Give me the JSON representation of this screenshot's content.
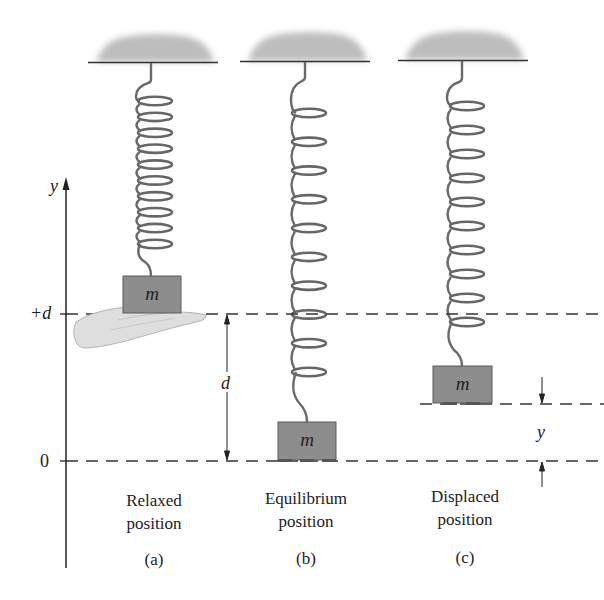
{
  "figure": {
    "axis": {
      "label": "y",
      "ticks": [
        {
          "label": "+d",
          "y": 314
        },
        {
          "label": "0",
          "y": 461
        }
      ]
    },
    "mass_label": "m",
    "dimension_labels": {
      "stretch": "d",
      "displacement": "y"
    },
    "panels": [
      {
        "id": "a",
        "caption_line1": "Relaxed",
        "caption_line2": "position",
        "sublabel": "(a)",
        "coils": 10,
        "supported_by_hand": true
      },
      {
        "id": "b",
        "caption_line1": "Equilibrium",
        "caption_line2": "position",
        "sublabel": "(b)",
        "coils": 10,
        "supported_by_hand": false
      },
      {
        "id": "c",
        "caption_line1": "Displaced",
        "caption_line2": "position",
        "sublabel": "(c)",
        "coils": 10,
        "supported_by_hand": false
      }
    ],
    "colors": {
      "ceiling": "#b8b8b8",
      "mass_fill": "#8a8a8a",
      "spring": "#666666",
      "line": "#333333",
      "hand": "#dcdcdc"
    }
  }
}
